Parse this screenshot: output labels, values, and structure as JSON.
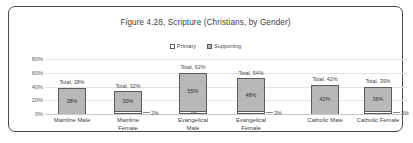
{
  "chart_data": {
    "type": "bar",
    "subtype": "stacked-column",
    "title": "Figure 4.28, Scripture (Christians, by Gender)",
    "xlabel": "",
    "ylabel": "",
    "ylim": [
      0,
      80
    ],
    "ytick_labels": [
      "80%",
      "60%",
      "40%",
      "20%",
      "0%"
    ],
    "ytick_values": [
      80,
      60,
      40,
      20,
      0
    ],
    "grid": true,
    "legend_position": "top",
    "categories": [
      "Mainline Male",
      "Mainline Female",
      "Evangelical Male",
      "Evangelical Female",
      "Catholic Male",
      "Catholic Female"
    ],
    "series": [
      {
        "name": "Primary",
        "values": [
          0,
          2,
          5,
          3,
          0,
          3
        ]
      },
      {
        "name": "Supporting",
        "values": [
          38,
          30,
          55,
          48,
          42,
          36
        ]
      }
    ],
    "totals": [
      38,
      32,
      62,
      54,
      42,
      39
    ],
    "total_label_prefix": "Total,",
    "bars": [
      {
        "category": "Mainline Male",
        "category_lines": [
          "Mainline Male"
        ],
        "total_label": "Total, 38%",
        "supporting_value": 38,
        "supporting_label": "38%",
        "primary_value": 0,
        "primary_label": "",
        "has_callout": false,
        "callout_label": ""
      },
      {
        "category": "Mainline Female",
        "category_lines": [
          "Mainline",
          "Female"
        ],
        "total_label": "Total, 32%",
        "supporting_value": 30,
        "supporting_label": "30%",
        "primary_value": 2,
        "primary_label": "",
        "has_callout": true,
        "callout_label": "2%"
      },
      {
        "category": "Evangelical Male",
        "category_lines": [
          "Evangelical",
          "Male"
        ],
        "total_label": "Total, 62%",
        "supporting_value": 55,
        "supporting_label": "55%",
        "primary_value": 5,
        "primary_label": "5%",
        "has_callout": false,
        "callout_label": ""
      },
      {
        "category": "Evangelical Female",
        "category_lines": [
          "Evangelical",
          "Female"
        ],
        "total_label": "Total, 54%",
        "supporting_value": 48,
        "supporting_label": "48%",
        "primary_value": 3,
        "primary_label": "",
        "has_callout": true,
        "callout_label": "3%"
      },
      {
        "category": "Catholic Male",
        "category_lines": [
          "Catholic Male"
        ],
        "total_label": "Total, 42%",
        "supporting_value": 42,
        "supporting_label": "42%",
        "primary_value": 0,
        "primary_label": "",
        "has_callout": false,
        "callout_label": ""
      },
      {
        "category": "Catholic Female",
        "category_lines": [
          "Catholic Female"
        ],
        "total_label": "Total, 39%",
        "supporting_value": 36,
        "supporting_label": "36%",
        "primary_value": 3,
        "primary_label": "",
        "has_callout": true,
        "callout_label": "3%"
      }
    ],
    "colors": {
      "supporting_fill": "#b8b8b8",
      "primary_fill": "#ffffff",
      "series_outline": "#5c5c5c",
      "gridline": "#e2e2e2",
      "text": "#3f3f3f",
      "frame": "#4a4a4a"
    }
  },
  "legend": {
    "items": [
      {
        "label": "Primary",
        "swatch": "primary"
      },
      {
        "label": "Supporting",
        "swatch": "supporting"
      }
    ]
  }
}
